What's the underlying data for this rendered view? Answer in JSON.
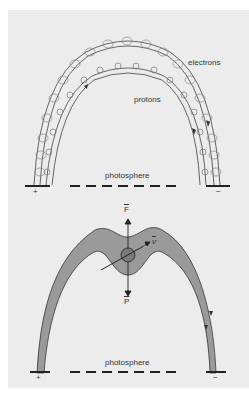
{
  "figure": {
    "top_panel": {
      "labels": {
        "electrons": "electrons",
        "protons": "protons",
        "photosphere": "photosphere",
        "plus": "+",
        "minus": "−"
      }
    },
    "bottom_panel": {
      "labels": {
        "force": "F",
        "velocity": "v",
        "pressure": "P",
        "photosphere": "photosphere",
        "plus": "+",
        "minus": "−"
      }
    },
    "colors": {
      "background": "#ececec",
      "tube_fill": "#9a9a9a",
      "line": "#333333"
    }
  }
}
